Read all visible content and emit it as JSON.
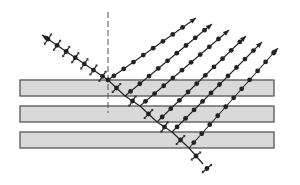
{
  "diagram": {
    "colors": {
      "plate_fill": "#d9d9d9",
      "plate_stroke": "#555555",
      "ray": "#222222",
      "normal": "#555555",
      "background": "#ffffff"
    },
    "plates": [
      {
        "x": 20,
        "y": 80,
        "w": 254,
        "h": 16
      },
      {
        "x": 20,
        "y": 106,
        "w": 254,
        "h": 16
      },
      {
        "x": 20,
        "y": 132,
        "w": 254,
        "h": 16
      }
    ],
    "normal_line": {
      "x": 108,
      "y1": 12,
      "y2": 113
    },
    "incident_ray": {
      "from": [
        108,
        80
      ],
      "to": [
        42,
        35
      ],
      "markers": "dot-and-cross (unpolarized)"
    },
    "transmitted_ray": {
      "points": [
        [
          108,
          80
        ],
        [
          125,
          96
        ],
        [
          140,
          106
        ],
        [
          157,
          122
        ],
        [
          172,
          132
        ],
        [
          189,
          148
        ],
        [
          203,
          164
        ]
      ],
      "markers": "dot-and-cross (partially polarized)"
    },
    "reflected_rays": [
      {
        "from": [
          108,
          80
        ],
        "to": [
          196,
          18
        ]
      },
      {
        "from": [
          125,
          96
        ],
        "to": [
          212,
          24
        ]
      },
      {
        "from": [
          140,
          106
        ],
        "to": [
          229,
          30
        ]
      },
      {
        "from": [
          157,
          122
        ],
        "to": [
          246,
          36
        ]
      },
      {
        "from": [
          172,
          132
        ],
        "to": [
          262,
          42
        ]
      },
      {
        "from": [
          189,
          148
        ],
        "to": [
          278,
          48
        ]
      }
    ],
    "reflected_marker": "dot (s-polarized)"
  }
}
